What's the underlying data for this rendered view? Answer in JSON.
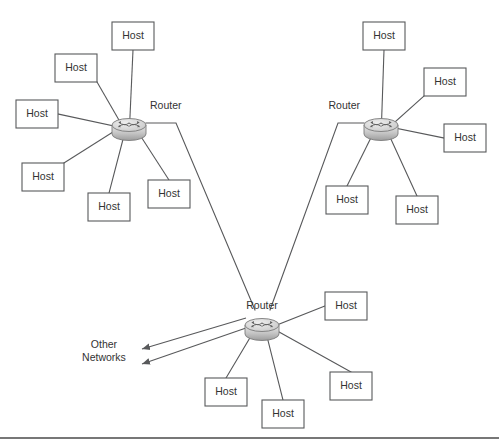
{
  "diagram": {
    "type": "network-topology",
    "canvas": {
      "width": 499,
      "height": 447,
      "background": "#ffffff"
    },
    "colors": {
      "line": "#58595b",
      "box_fill": "#ffffff",
      "text": "#333333",
      "router_body_light": "#e2e2e2",
      "router_body_dark": "#9a9a9a",
      "router_top": "#d0d0d0",
      "router_outline": "#7b7b7b",
      "footer_rule": "#4a4a4a"
    },
    "labels": {
      "host": "Host",
      "router": "Router",
      "other_networks_line1": "Other",
      "other_networks_line2": "Networks"
    },
    "routers": [
      {
        "id": "router-left",
        "label": "Router",
        "cx": 129,
        "cy": 125,
        "rx": 17,
        "ry": 6.5,
        "h": 9,
        "label_x": 150,
        "label_y": 106,
        "label_anchor": "start"
      },
      {
        "id": "router-right",
        "label": "Router",
        "cx": 381,
        "cy": 125,
        "rx": 17,
        "ry": 6.5,
        "h": 9,
        "label_x": 360,
        "label_y": 106,
        "label_anchor": "end"
      },
      {
        "id": "router-center",
        "label": "Router",
        "cx": 262,
        "cy": 325,
        "rx": 17,
        "ry": 6.5,
        "h": 9,
        "label_x": 262,
        "label_y": 306,
        "label_anchor": "middle"
      }
    ],
    "hosts": [
      {
        "id": "host-l1",
        "label": "Host",
        "x": 112,
        "y": 22,
        "w": 42,
        "h": 28,
        "router": "router-left",
        "anchor": "bottom-center"
      },
      {
        "id": "host-l2",
        "label": "Host",
        "x": 55,
        "y": 54,
        "w": 42,
        "h": 28,
        "router": "router-left",
        "anchor": "bottom-right"
      },
      {
        "id": "host-l3",
        "label": "Host",
        "x": 16,
        "y": 100,
        "w": 42,
        "h": 28,
        "router": "router-left",
        "anchor": "right-center"
      },
      {
        "id": "host-l4",
        "label": "Host",
        "x": 22,
        "y": 163,
        "w": 42,
        "h": 28,
        "router": "router-left",
        "anchor": "top-right"
      },
      {
        "id": "host-l5",
        "label": "Host",
        "x": 88,
        "y": 193,
        "w": 42,
        "h": 28,
        "router": "router-left",
        "anchor": "top-center"
      },
      {
        "id": "host-l6",
        "label": "Host",
        "x": 148,
        "y": 180,
        "w": 42,
        "h": 28,
        "router": "router-left",
        "anchor": "top-center"
      },
      {
        "id": "host-r1",
        "label": "Host",
        "x": 363,
        "y": 22,
        "w": 42,
        "h": 28,
        "router": "router-right",
        "anchor": "bottom-center"
      },
      {
        "id": "host-r2",
        "label": "Host",
        "x": 424,
        "y": 68,
        "w": 42,
        "h": 28,
        "router": "router-right",
        "anchor": "bottom-left"
      },
      {
        "id": "host-r3",
        "label": "Host",
        "x": 444,
        "y": 124,
        "w": 42,
        "h": 28,
        "router": "router-right",
        "anchor": "left-center"
      },
      {
        "id": "host-r4",
        "label": "Host",
        "x": 326,
        "y": 186,
        "w": 42,
        "h": 28,
        "router": "router-right",
        "anchor": "top-center"
      },
      {
        "id": "host-r5",
        "label": "Host",
        "x": 396,
        "y": 196,
        "w": 42,
        "h": 28,
        "router": "router-right",
        "anchor": "top-center"
      },
      {
        "id": "host-c1",
        "label": "Host",
        "x": 325,
        "y": 292,
        "w": 42,
        "h": 28,
        "router": "router-center",
        "anchor": "left-center"
      },
      {
        "id": "host-c2",
        "label": "Host",
        "x": 205,
        "y": 378,
        "w": 42,
        "h": 28,
        "router": "router-center",
        "anchor": "top-center"
      },
      {
        "id": "host-c3",
        "label": "Host",
        "x": 262,
        "y": 400,
        "w": 42,
        "h": 28,
        "router": "router-center",
        "anchor": "top-center"
      },
      {
        "id": "host-c4",
        "label": "Host",
        "x": 330,
        "y": 372,
        "w": 42,
        "h": 28,
        "router": "router-center",
        "anchor": "top-center"
      }
    ],
    "router_links": [
      {
        "id": "link-left-center",
        "from": "router-left",
        "to": "router-center",
        "points": "146,123 176,123 255,310"
      },
      {
        "id": "link-right-center",
        "from": "router-right",
        "to": "router-center",
        "points": "364,123 338,123 270,310"
      }
    ],
    "wan_arrows": [
      {
        "id": "wan-arrow-1",
        "x1": 246,
        "y1": 318,
        "x2": 142,
        "y2": 349
      },
      {
        "id": "wan-arrow-2",
        "x1": 246,
        "y1": 328,
        "x2": 142,
        "y2": 364
      }
    ],
    "other_networks": {
      "x": 104,
      "y": 348,
      "line_gap": 13
    },
    "footer_rule": {
      "x1": 0,
      "y1": 438,
      "x2": 499,
      "y2": 438
    }
  }
}
